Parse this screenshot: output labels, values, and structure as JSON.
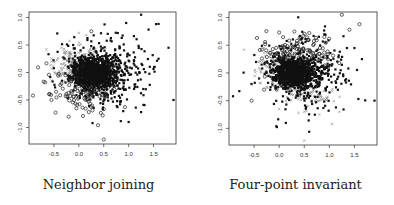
{
  "chart_data": [
    {
      "type": "scatter",
      "title": "Neighbor joining",
      "xlabel": "",
      "ylabel": "",
      "xlim": [
        -1.0,
        1.95
      ],
      "ylim": [
        -1.3,
        1.1
      ],
      "xticks": [
        "-0.5",
        "0.0",
        "0.5",
        "1.0",
        "1.5"
      ],
      "yticks": [
        "1.0",
        "0.5",
        "0.0",
        "-0.5",
        "-1.0"
      ],
      "grid": false,
      "legend": null,
      "series": [
        {
          "name": "filled",
          "marker": "filled-square",
          "color": "#111111",
          "description": "dense cluster centred near (0.3, 0.0), spreading to x≈1.8, y≈1.05",
          "sample_points": [
            [
              1.25,
              1.05
            ],
            [
              1.55,
              0.88
            ],
            [
              1.4,
              0.78
            ],
            [
              1.8,
              0.45
            ],
            [
              1.6,
              0.25
            ],
            [
              1.9,
              -0.5
            ],
            [
              1.0,
              -0.9
            ],
            [
              1.25,
              -0.72
            ],
            [
              0.95,
              0.9
            ],
            [
              0.3,
              0.0
            ]
          ]
        },
        {
          "name": "open-diamond",
          "marker": "open-circle",
          "color": "#222222",
          "description": "open markers on the left/lower edge of the cluster",
          "sample_points": [
            [
              -0.92,
              -0.42
            ],
            [
              -0.55,
              -0.5
            ],
            [
              -0.35,
              -0.2
            ],
            [
              -0.27,
              -0.05
            ],
            [
              -0.05,
              -0.65
            ],
            [
              0.2,
              -0.72
            ],
            [
              0.48,
              -0.78
            ],
            [
              0.5,
              -1.22
            ],
            [
              0.25,
              0.75
            ]
          ]
        },
        {
          "name": "cross",
          "marker": "x",
          "color": "#888888",
          "description": "grey crosses concentrated at upper-left of cluster",
          "sample_points": [
            [
              -0.65,
              0.42
            ],
            [
              -0.55,
              0.2
            ],
            [
              -0.35,
              0.45
            ],
            [
              -0.25,
              0.38
            ],
            [
              -0.15,
              0.2
            ],
            [
              0.0,
              0.72
            ],
            [
              0.15,
              0.68
            ]
          ]
        }
      ]
    },
    {
      "type": "scatter",
      "title": "Four-point invariant",
      "xlabel": "",
      "ylabel": "",
      "xlim": [
        -1.0,
        1.95
      ],
      "ylim": [
        -1.3,
        1.1
      ],
      "xticks": [
        "-0.5",
        "0.0",
        "0.5",
        "1.0",
        "1.5"
      ],
      "yticks": [
        "1.0",
        "0.5",
        "0.0",
        "-0.5",
        "-1.0"
      ],
      "grid": false,
      "legend": null,
      "series": [
        {
          "name": "filled",
          "marker": "filled-square",
          "color": "#111111",
          "description": "dense cluster centred near (0.3, 0.05), tail to the right",
          "sample_points": [
            [
              -0.92,
              -0.42
            ],
            [
              -0.35,
              0.15
            ],
            [
              -0.4,
              -0.1
            ],
            [
              1.35,
              0.45
            ],
            [
              1.65,
              0.25
            ],
            [
              1.9,
              -0.5
            ],
            [
              1.5,
              0.45
            ],
            [
              0.3,
              0.05
            ]
          ]
        },
        {
          "name": "open-circle",
          "marker": "open-circle",
          "color": "#222222",
          "description": "open circles on the upper part of the cluster",
          "sample_points": [
            [
              1.25,
              1.05
            ],
            [
              1.6,
              0.88
            ],
            [
              1.4,
              0.78
            ],
            [
              0.0,
              0.73
            ],
            [
              -0.55,
              -0.5
            ],
            [
              -0.3,
              -0.3
            ],
            [
              -0.05,
              -0.3
            ],
            [
              0.6,
              0.72
            ],
            [
              0.9,
              0.65
            ]
          ]
        },
        {
          "name": "cross",
          "marker": "x",
          "color": "#888888",
          "description": "grey crosses in lower band of cluster, sloping down to the right",
          "sample_points": [
            [
              -0.7,
              0.42
            ],
            [
              -0.4,
              0.2
            ],
            [
              0.5,
              -0.7
            ],
            [
              0.8,
              -0.75
            ],
            [
              1.05,
              -0.92
            ],
            [
              1.2,
              -0.7
            ],
            [
              0.5,
              -1.22
            ],
            [
              0.0,
              -0.65
            ],
            [
              -0.3,
              0.45
            ]
          ]
        }
      ]
    }
  ],
  "panels": [
    {
      "caption": "Neighbor joining"
    },
    {
      "caption": "Four-point invariant"
    }
  ]
}
